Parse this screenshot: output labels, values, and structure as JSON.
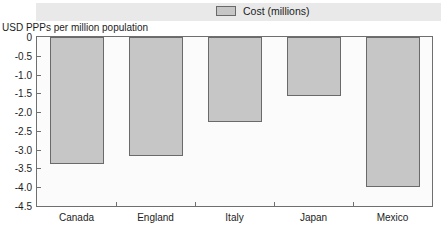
{
  "legend": {
    "label": "Cost (millions)",
    "swatch_color": "#c6c6c6",
    "swatch_border": "#6a6a6a"
  },
  "axis_caption": "USD PPPs per million population",
  "chart_data": {
    "type": "bar",
    "title": "",
    "xlabel": "",
    "ylabel": "USD PPPs per million population",
    "categories": [
      "Canada",
      "England",
      "Italy",
      "Japan",
      "Mexico"
    ],
    "series": [
      {
        "name": "Cost (millions)",
        "values": [
          -3.38,
          -3.18,
          -2.25,
          -1.57,
          -4.0
        ]
      }
    ],
    "ylim": [
      -4.5,
      0
    ],
    "ytick_labels": [
      "0",
      "-0.5",
      "-1.0",
      "-1.5",
      "-2.0",
      "-2.5",
      "-3.0",
      "-3.5",
      "-4.0",
      "-4.5"
    ],
    "ytick_values": [
      0,
      -0.5,
      -1.0,
      -1.5,
      -2.0,
      -2.5,
      -3.0,
      -3.5,
      -4.0,
      -4.5
    ],
    "grid": false,
    "legend_position": "top-center",
    "bar_color": "#c6c6c6",
    "bar_edge_color": "#6a6a6a",
    "orientation": "vertical-downward"
  }
}
